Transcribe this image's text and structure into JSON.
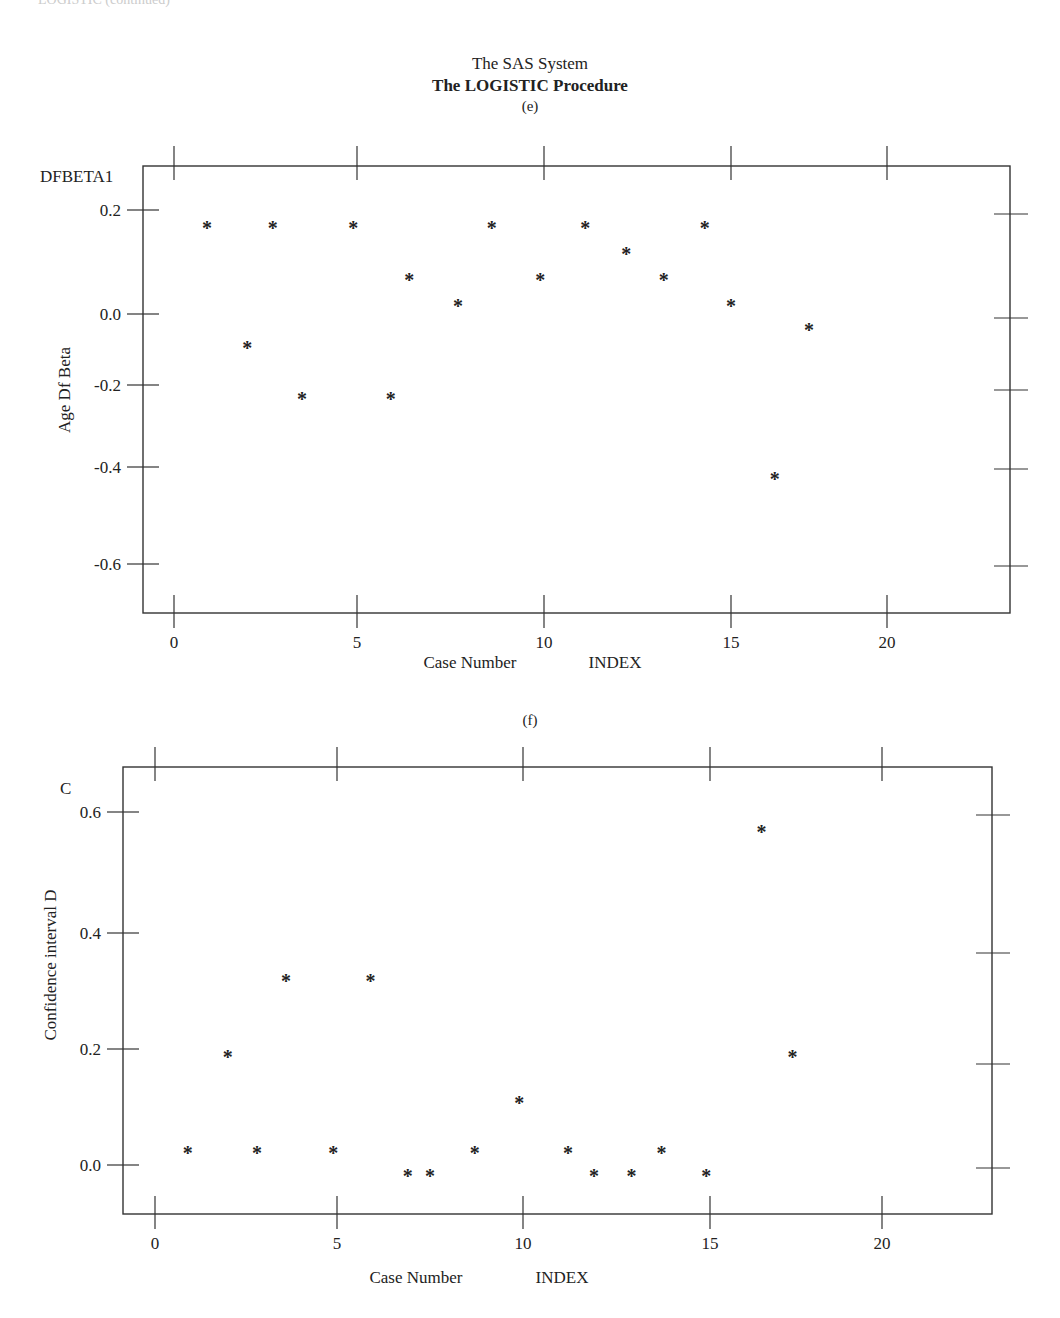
{
  "header": {
    "cut_off_top_text": "LOGISTIC (continued)",
    "system_title": "The SAS System",
    "procedure_title": "The LOGISTIC Procedure"
  },
  "chart_data": [
    {
      "panel": "(e)",
      "type": "scatter",
      "title": "(e)",
      "xlabel": "Case Number",
      "xvar": "INDEX",
      "ylabel": "Age Df Beta",
      "yvar": "DFBETA1",
      "marker": "*",
      "xlim": [
        -1,
        23
      ],
      "ylim": [
        -0.7,
        0.27
      ],
      "x_ticks": [
        0,
        5,
        10,
        15,
        20
      ],
      "x_tick_labels": [
        "0",
        "5",
        "10",
        "15",
        "20"
      ],
      "y_ticks": [
        0.2,
        0.0,
        -0.2,
        -0.4,
        -0.6
      ],
      "y_tick_labels": [
        "0.2",
        "0.0",
        "-0.2",
        "-0.4",
        "-0.6"
      ],
      "grid": false,
      "x": [
        0.9,
        2.0,
        2.7,
        3.5,
        4.9,
        5.9,
        6.4,
        7.7,
        8.6,
        9.9,
        11.1,
        12.2,
        13.2,
        14.3,
        15.0,
        16.4,
        17.5
      ],
      "y": [
        0.17,
        -0.09,
        0.17,
        -0.23,
        0.17,
        -0.23,
        0.07,
        0.02,
        0.17,
        0.07,
        0.17,
        0.12,
        0.07,
        0.17,
        0.02,
        -0.42,
        -0.04
      ]
    },
    {
      "panel": "(f)",
      "type": "scatter",
      "title": "(f)",
      "xlabel": "Case Number",
      "xvar": "INDEX",
      "ylabel": "Confidence interval D",
      "yvar": "C",
      "marker": "*",
      "xlim": [
        -1,
        23
      ],
      "ylim": [
        -0.08,
        0.65
      ],
      "x_ticks": [
        0,
        5,
        10,
        15,
        20
      ],
      "x_tick_labels": [
        "0",
        "5",
        "10",
        "15",
        "20"
      ],
      "y_ticks": [
        0.6,
        0.4,
        0.2,
        0.0
      ],
      "y_tick_labels": [
        "0.6",
        "0.4",
        "0.2",
        "0.0"
      ],
      "grid": false,
      "x": [
        0.9,
        2.0,
        2.8,
        3.6,
        4.9,
        5.9,
        6.9,
        7.5,
        8.7,
        9.9,
        11.2,
        11.9,
        12.9,
        13.7,
        14.9,
        16.5,
        17.4
      ],
      "y": [
        0.025,
        0.19,
        0.025,
        0.32,
        0.025,
        0.32,
        -0.015,
        -0.015,
        0.025,
        0.11,
        0.025,
        -0.015,
        -0.015,
        0.025,
        -0.015,
        0.57,
        0.19
      ]
    }
  ]
}
